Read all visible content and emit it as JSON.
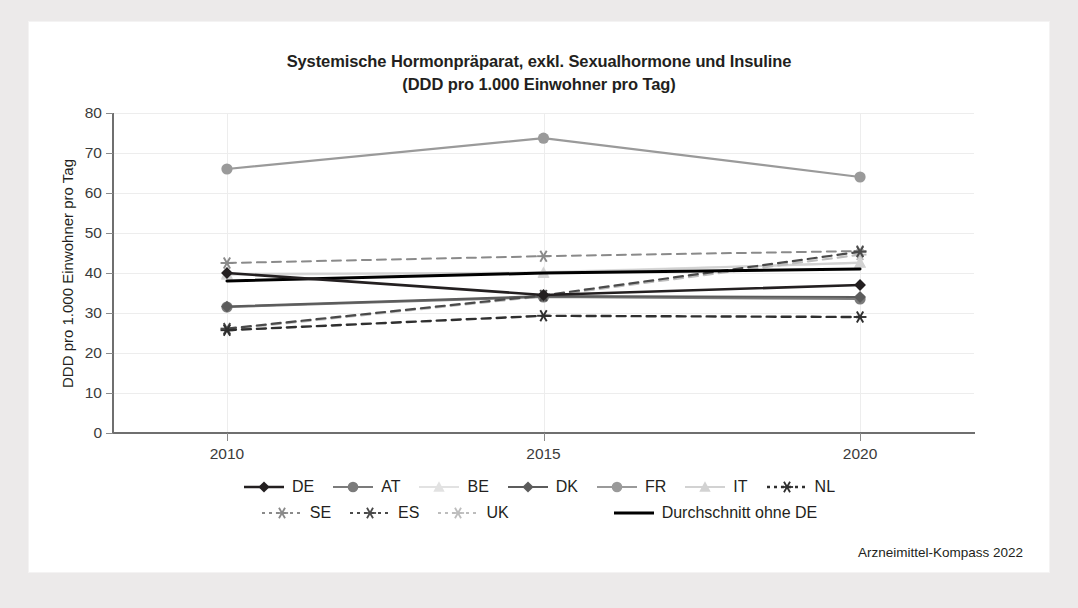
{
  "figure": {
    "title_lines": [
      "Systemische Hormonpräparat, exkl. Sexualhormone und Insuline",
      "(DDD pro 1.000 Einwohner pro Tag)"
    ],
    "source": "Arzneimittel-Kompass 2022"
  },
  "chart_data": {
    "type": "line",
    "title": "Systemische Hormonpräparat, exkl. Sexualhormone und Insuline (DDD pro 1.000 Einwohner pro Tag)",
    "xlabel": "",
    "ylabel": "DDD pro 1.000 Einwohner pro Tag",
    "x": [
      "2010",
      "2015",
      "2020"
    ],
    "categories": [
      "2010",
      "2015",
      "2020"
    ],
    "xlim": [
      2008.2,
      2021.8
    ],
    "ylim": [
      0,
      80
    ],
    "yticks": [
      0,
      10,
      20,
      30,
      40,
      50,
      60,
      70,
      80
    ],
    "ytick_labels": [
      "0",
      "10",
      "20",
      "30",
      "40",
      "50",
      "60",
      "70",
      "80"
    ],
    "xtick_labels": [
      "2010",
      "2015",
      "2020"
    ],
    "grid": "horizontal-and-vertical",
    "legend_position": "bottom",
    "series": [
      {
        "name": "DE",
        "values": [
          40.0,
          34.5,
          37.0
        ],
        "color": "#231f20",
        "marker": "diamond",
        "dash": "solid",
        "width": 2.6
      },
      {
        "name": "AT",
        "values": [
          31.5,
          34.0,
          33.5
        ],
        "color": "#7b7b7b",
        "marker": "circle",
        "dash": "solid",
        "width": 2.2
      },
      {
        "name": "BE",
        "values": [
          39.5,
          40.2,
          42.5
        ],
        "color": "#e2e2e2",
        "marker": "triangle",
        "dash": "solid",
        "width": 2.2
      },
      {
        "name": "DK",
        "values": [
          31.6,
          34.2,
          34.0
        ],
        "color": "#5c5c5c",
        "marker": "diamond",
        "dash": "solid",
        "width": 2.2
      },
      {
        "name": "FR",
        "values": [
          66.0,
          73.7,
          64.0
        ],
        "color": "#9a9a9a",
        "marker": "circle",
        "dash": "solid",
        "width": 2.2
      },
      {
        "name": "IT",
        "values": [
          39.8,
          40.0,
          42.6
        ],
        "color": "#d2d2d2",
        "marker": "triangle",
        "dash": "solid",
        "width": 2.2
      },
      {
        "name": "NL",
        "values": [
          25.7,
          29.3,
          29.0
        ],
        "color": "#2f2f2f",
        "marker": "asterisk",
        "dash": "dashed",
        "width": 2.4
      },
      {
        "name": "SE",
        "values": [
          42.5,
          44.2,
          45.5
        ],
        "color": "#8a8a8a",
        "marker": "asterisk",
        "dash": "dashed",
        "width": 2.0
      },
      {
        "name": "ES",
        "values": [
          26.1,
          34.4,
          45.3
        ],
        "color": "#4a4a4a",
        "marker": "asterisk",
        "dash": "dashed",
        "width": 2.2
      },
      {
        "name": "UK",
        "values": [
          25.9,
          34.2,
          44.6
        ],
        "color": "#bdbdbd",
        "marker": "asterisk",
        "dash": "dashed",
        "width": 2.2
      },
      {
        "name": "Durchschnitt ohne DE",
        "values": [
          38.0,
          40.0,
          41.0
        ],
        "color": "#000000",
        "marker": "none",
        "dash": "solid",
        "width": 3.0
      }
    ]
  },
  "legend": {
    "rows": [
      [
        "DE",
        "AT",
        "BE",
        "DK",
        "FR",
        "IT",
        "NL"
      ],
      [
        "SE",
        "ES",
        "UK",
        "Durchschnitt ohne DE"
      ]
    ]
  }
}
